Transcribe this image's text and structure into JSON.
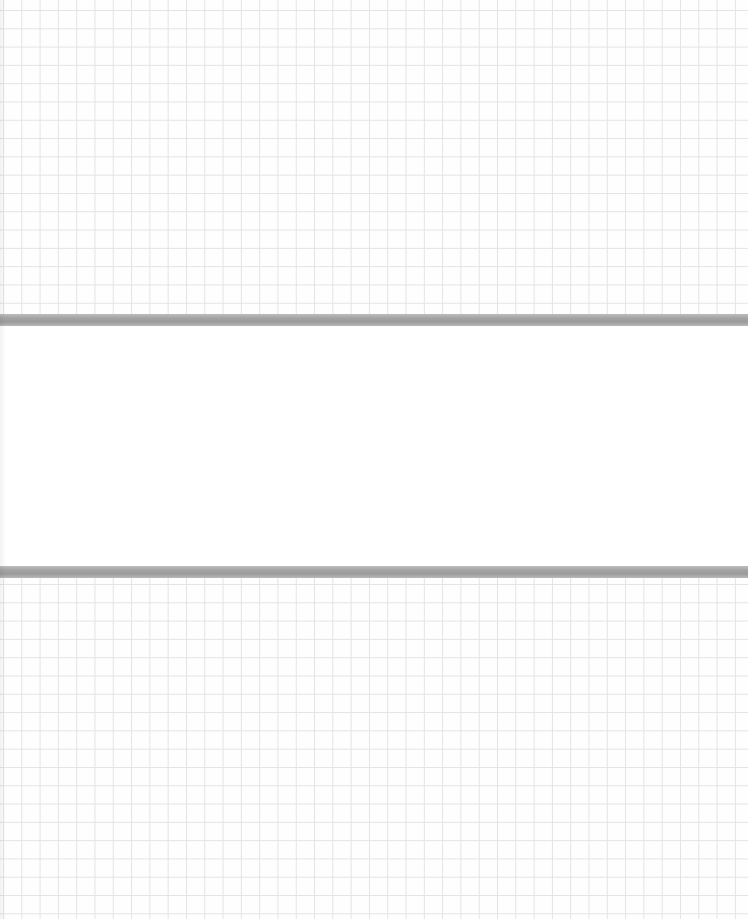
{
  "page": {
    "colors": {
      "grid_line": "#e3e3e3",
      "paper": "#fefefe",
      "strip": "#ffffff",
      "bar": "#a3a3a3"
    },
    "grid_spacing_px": 18.3,
    "strip_text": ""
  }
}
